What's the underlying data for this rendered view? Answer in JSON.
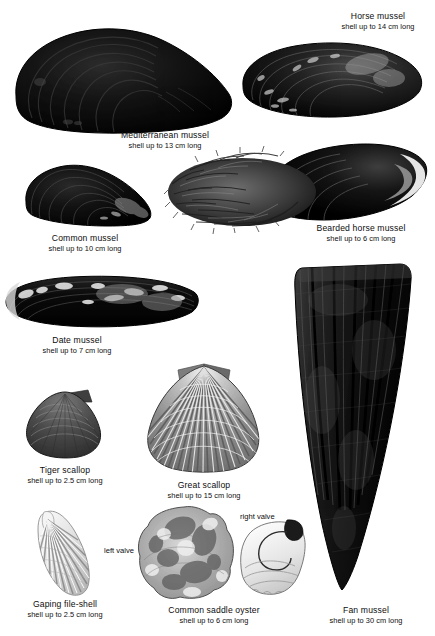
{
  "plate": {
    "title": "Bivalve molluscs shell identification plate",
    "background_color": "#ffffff",
    "text_color": "#0d0d0d"
  },
  "specimens": [
    {
      "id": "mediterranean-mussel",
      "name": "Mediterranean mussel",
      "size": "shell up to 13 cm long",
      "shape": "mussel-wedge",
      "tone": "#0a0a0a"
    },
    {
      "id": "horse-mussel",
      "name": "Horse mussel",
      "size": "shell up to 14 cm long",
      "shape": "mussel-oval",
      "tone": "#151515"
    },
    {
      "id": "common-mussel",
      "name": "Common mussel",
      "size": "shell up to 10 cm long",
      "shape": "mussel-teardrop",
      "tone": "#0b0b0b"
    },
    {
      "id": "bearded-horse-mussel",
      "name": "Bearded horse mussel",
      "size": "shell up to 6 cm long",
      "shape": "mussel-bearded",
      "tone": "#101010"
    },
    {
      "id": "date-mussel",
      "name": "Date mussel",
      "size": "shell up to 7 cm long",
      "shape": "mussel-elongate",
      "tone": "#090909"
    },
    {
      "id": "tiger-scallop",
      "name": "Tiger scallop",
      "size": "shell up to 2.5 cm long",
      "shape": "scallop-small",
      "tone": "#5a5a5a"
    },
    {
      "id": "great-scallop",
      "name": "Great scallop",
      "size": "shell up to 15 cm long",
      "shape": "scallop-large",
      "tone": "#8d8d8d"
    },
    {
      "id": "gaping-file-shell",
      "name": "Gaping file-shell",
      "size": "shell up to 2.5 cm long",
      "shape": "file-shell",
      "tone": "#cfcfcf"
    },
    {
      "id": "common-saddle-oyster",
      "name": "Common saddle oyster",
      "size": "shell up to 6 cm long",
      "shape": "saddle-oyster",
      "tone": "#b4b4b4",
      "valves": {
        "left": "left valve",
        "right": "right valve"
      }
    },
    {
      "id": "fan-mussel",
      "name": "Fan mussel",
      "size": "shell up to 30 cm long",
      "shape": "fan-mussel",
      "tone": "#1a1a1a"
    }
  ]
}
